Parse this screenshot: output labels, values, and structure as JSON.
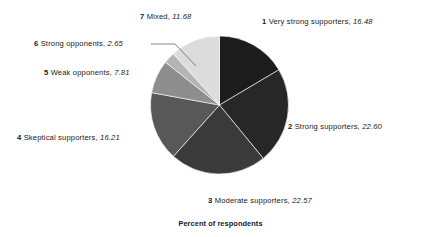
{
  "chart_data": {
    "type": "pie",
    "title": "",
    "xlabel": "",
    "ylabel": "",
    "caption": "Percent of respondents",
    "start_angle_deg": 0,
    "direction": "clockwise",
    "legend": "callout-labels",
    "grid": false,
    "categories": [
      "Very strong supporters",
      "Strong supporters",
      "Moderate supporters",
      "Skeptical supporters",
      "Weak opponents",
      "Strong opponents",
      "Mixed"
    ],
    "values": [
      16.48,
      22.6,
      22.57,
      16.21,
      7.81,
      2.65,
      11.68
    ],
    "colors": [
      "#1c1c1c",
      "#272727",
      "#3a3a3a",
      "#585858",
      "#8e8e8e",
      "#b4b4b4",
      "#dcdcdc"
    ],
    "slices": [
      {
        "index": "1",
        "label": "Very strong supporters",
        "value": "16.48",
        "color": "#1c1c1c"
      },
      {
        "index": "2",
        "label": "Strong supporters",
        "value": "22.60",
        "color": "#272727"
      },
      {
        "index": "3",
        "label": "Moderate supporters",
        "value": "22.57",
        "color": "#3a3a3a"
      },
      {
        "index": "4",
        "label": "Skeptical supporters",
        "value": "16.21",
        "color": "#585858"
      },
      {
        "index": "5",
        "label": "Weak opponents",
        "value": "7.81",
        "color": "#8e8e8e"
      },
      {
        "index": "6",
        "label": "Strong opponents",
        "value": "2.65",
        "color": "#b4b4b4"
      },
      {
        "index": "7",
        "label": "Mixed",
        "value": "11.68",
        "color": "#dcdcdc"
      }
    ]
  },
  "labels": {
    "l1": {
      "num": "1",
      "text": "Very strong supporters,",
      "value": "16.48"
    },
    "l2": {
      "num": "2",
      "text": "Strong supporters,",
      "value": "22.60"
    },
    "l3": {
      "num": "3",
      "text": "Moderate supporters,",
      "value": "22.57"
    },
    "l4": {
      "num": "4",
      "text": "Skeptical supporters,",
      "value": "16.21"
    },
    "l5": {
      "num": "5",
      "text": "Weak opponents,",
      "value": "7.81"
    },
    "l6": {
      "num": "6",
      "text": "Strong opponents,",
      "value": "2.65"
    },
    "l7": {
      "num": "7",
      "text": "Mixed,",
      "value": "11.68"
    }
  },
  "caption": {
    "text": "Percent of respondents"
  }
}
